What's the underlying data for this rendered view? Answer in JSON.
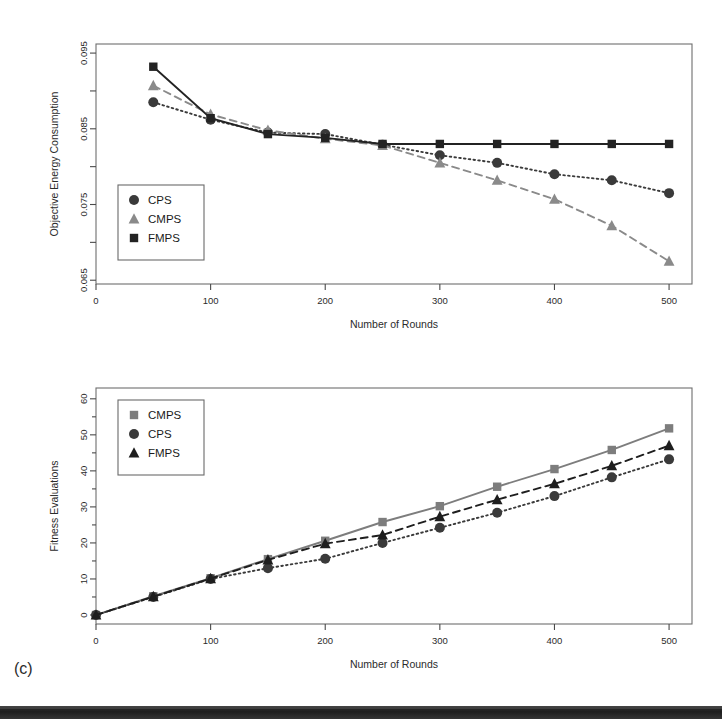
{
  "figure": {
    "caption": "(c)"
  },
  "chart_data": [
    {
      "id": "objective-energy-consumption",
      "type": "line",
      "title": "",
      "xlabel": "Number of Rounds",
      "ylabel": "Objective Energy Consumption",
      "x": [
        50,
        100,
        150,
        200,
        250,
        300,
        350,
        400,
        450,
        500
      ],
      "xlim": [
        0,
        520
      ],
      "ylim": [
        0.0645,
        0.0962
      ],
      "xticks": [
        0,
        100,
        200,
        300,
        400,
        500
      ],
      "xticklabels": [
        "0",
        "100",
        "200",
        "300",
        "400",
        "500"
      ],
      "yticks": [
        0.065,
        0.075,
        0.085,
        0.095
      ],
      "yticklabels": [
        "0.065",
        "0.075",
        "0.085",
        "0.095"
      ],
      "yminorticks": [
        0.07,
        0.08,
        0.09
      ],
      "grid": false,
      "legend_position": "bottom-left",
      "series": [
        {
          "name": "CPS",
          "marker": "circle",
          "linestyle": "dotted",
          "color": "#3a3a3a",
          "values": [
            0.0885,
            0.0862,
            0.0845,
            0.0843,
            0.0829,
            0.0815,
            0.0805,
            0.079,
            0.0782,
            0.0765
          ]
        },
        {
          "name": "CMPS",
          "marker": "triangle",
          "linestyle": "dashed",
          "color": "#8a8a8a",
          "values": [
            0.0907,
            0.0869,
            0.0848,
            0.0837,
            0.0828,
            0.0805,
            0.0782,
            0.0757,
            0.0722,
            0.0675
          ]
        },
        {
          "name": "FMPS",
          "marker": "square",
          "linestyle": "solid",
          "color": "#232323",
          "values": [
            0.0932,
            0.0864,
            0.0843,
            0.0838,
            0.083,
            0.083,
            0.083,
            0.083,
            0.083,
            0.083
          ]
        }
      ]
    },
    {
      "id": "fitness-evaluations",
      "type": "line",
      "title": "",
      "xlabel": "Number of Rounds",
      "ylabel": "Fitness Evaluations",
      "x": [
        0,
        50,
        100,
        150,
        200,
        250,
        300,
        350,
        400,
        450,
        500
      ],
      "xlim": [
        0,
        520
      ],
      "ylim": [
        -2.5,
        63
      ],
      "xticks": [
        0,
        100,
        200,
        300,
        400,
        500
      ],
      "xticklabels": [
        "0",
        "100",
        "200",
        "300",
        "400",
        "500"
      ],
      "yticks": [
        0,
        10,
        20,
        30,
        40,
        50,
        60
      ],
      "yticklabels": [
        "0",
        "10",
        "20",
        "30",
        "40",
        "50",
        "60"
      ],
      "grid": false,
      "legend_position": "top-left",
      "series": [
        {
          "name": "CMPS",
          "marker": "square",
          "linestyle": "solid",
          "color": "#7d7d7d",
          "values": [
            0,
            5.2,
            10.2,
            15.5,
            20.6,
            25.8,
            30.2,
            35.6,
            40.5,
            45.8,
            51.8
          ]
        },
        {
          "name": "CPS",
          "marker": "circle",
          "linestyle": "dotted",
          "color": "#3a3a3a",
          "values": [
            0,
            5.0,
            10.0,
            13.0,
            15.6,
            20.0,
            24.2,
            28.4,
            33.0,
            38.2,
            43.2
          ]
        },
        {
          "name": "FMPS",
          "marker": "triangle",
          "linestyle": "dashed",
          "color": "#1e1e1e",
          "values": [
            0,
            5.1,
            10.1,
            15.3,
            19.8,
            22.2,
            27.3,
            32.0,
            36.4,
            41.4,
            47.0
          ]
        }
      ]
    }
  ]
}
